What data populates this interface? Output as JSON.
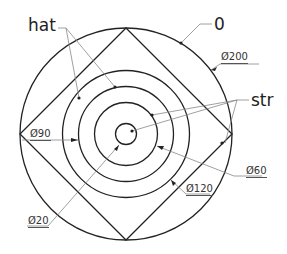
{
  "diagram": {
    "type": "concentric-circles-with-inscribed-square",
    "labels": {
      "hat": "hat",
      "zero": "0",
      "str": "str"
    },
    "dimensions": {
      "d200": "Ø200",
      "d90": "Ø90",
      "d60": "Ø60",
      "d120": "Ø120",
      "d20": "Ø20"
    },
    "circles": [
      {
        "name": "outer",
        "diameter": 200
      },
      {
        "name": "c120",
        "diameter": 120
      },
      {
        "name": "c90",
        "diameter": 90
      },
      {
        "name": "c60",
        "diameter": 60
      },
      {
        "name": "c20",
        "diameter": 20
      }
    ],
    "colors": {
      "line": "#222222",
      "leader": "#777777",
      "background": "#ffffff"
    }
  }
}
